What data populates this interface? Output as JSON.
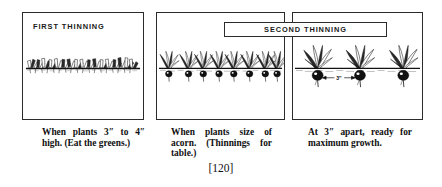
{
  "figure": {
    "page_number": "[120]",
    "panels": [
      {
        "id": "first-thinning",
        "label": "FIRST THINNING",
        "label_boxed": false,
        "caption": "When plants 3″ to 4″ high. (Eat the greens.)",
        "scene": "dense row of tiny seedling tops emerging along soil line"
      },
      {
        "id": "second-thinning-left",
        "label": "SECOND THINNING",
        "label_boxed": true,
        "caption": "When plants size of acorn. (Thinnings for table.)",
        "scene": "row of small beet plants with acorn sized roots at soil line"
      },
      {
        "id": "second-thinning-right",
        "label": "",
        "label_boxed": false,
        "caption": "At 3″ apart, ready for maximum growth.",
        "scene": "three well spaced beet plants with large roots",
        "spacing_annotation": "3″"
      }
    ],
    "colors": {
      "ink": "#2b2b2b",
      "paper": "#ffffff",
      "text": "#101010"
    }
  }
}
